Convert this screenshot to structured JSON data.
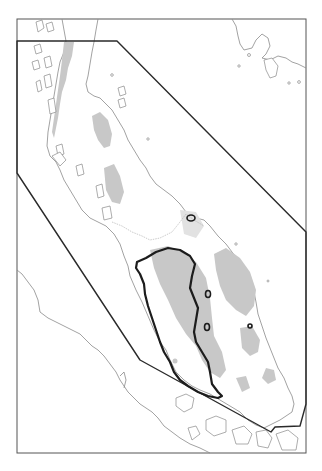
{
  "map": {
    "type": "distribution-range-map",
    "region_depicted": "Malay Peninsula with surrounding coastlines (Sumatra coast to the southwest, Gulf of Thailand islands to the northeast)",
    "frame": {
      "x": 17,
      "y": 19,
      "width": 289,
      "height": 434
    },
    "study_area_polygon": [
      [
        17,
        41
      ],
      [
        117,
        41
      ],
      [
        306,
        232
      ],
      [
        306,
        404
      ],
      [
        300,
        426
      ],
      [
        275,
        427
      ],
      [
        271,
        432
      ],
      [
        140,
        360
      ],
      [
        17,
        173
      ]
    ],
    "range_outline": {
      "description": "Thick dark outline over the west-central peninsula"
    },
    "small_range_patches": 4,
    "colors": {
      "background": "#ffffff",
      "coastline": "#8a8a8a",
      "highland_shading": "#c8c8c8",
      "range_outline": "#1c1c1c",
      "study_area_outline": "#2a2a2a",
      "frame": "#555555"
    },
    "legend": null,
    "labels": []
  }
}
